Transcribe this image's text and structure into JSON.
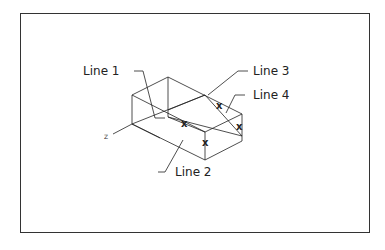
{
  "labels": {
    "line1": "Line 1",
    "line2": "Line 2",
    "line3": "Line 3",
    "line4": "Line 4"
  },
  "axes": {
    "x": "X",
    "y": "Y",
    "z": "Z"
  },
  "markers": [
    "X",
    "X",
    "X",
    "X"
  ]
}
